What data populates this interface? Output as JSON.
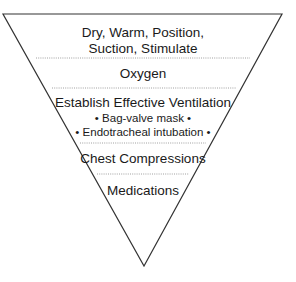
{
  "diagram": {
    "type": "inverted-pyramid",
    "shape": {
      "top_left": [
        3,
        14
      ],
      "top_right": [
        282,
        14
      ],
      "apex": [
        144,
        266
      ],
      "stroke_color": "#333333"
    },
    "dividers": [
      {
        "y": 58,
        "x1": 36,
        "x2": 250
      },
      {
        "y": 88,
        "x1": 52,
        "x2": 236
      },
      {
        "y": 143,
        "x1": 80,
        "x2": 206
      },
      {
        "y": 174,
        "x1": 97,
        "x2": 189
      }
    ],
    "levels": [
      {
        "lines": [
          "Dry, Warm, Position,",
          "Suction, Stimulate"
        ]
      },
      {
        "lines": [
          "Oxygen"
        ]
      },
      {
        "lines": [
          "Establish Effective Ventilation"
        ],
        "sub_items": [
          "• Bag-valve mask •",
          "• Endotracheal intubation •"
        ]
      },
      {
        "lines": [
          "Chest Compressions"
        ]
      },
      {
        "lines": [
          "Medications"
        ]
      }
    ]
  }
}
